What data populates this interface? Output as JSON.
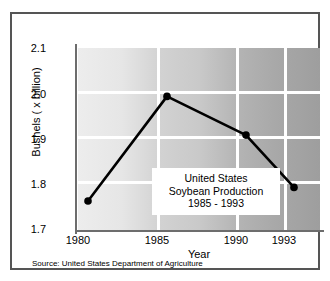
{
  "chart_data": {
    "type": "line",
    "title": "United States Soybean Production 1985 - 1993",
    "title_lines": [
      "United States",
      "Soybean Production",
      "1985 - 1993"
    ],
    "xlabel": "Year",
    "ylabel": "Bushels ( x billion)",
    "categories": [
      "1980",
      "1985",
      "1990",
      "1993"
    ],
    "x": [
      1980,
      1985,
      1990,
      1993
    ],
    "values": [
      1.79,
      2.02,
      1.935,
      1.82
    ],
    "series": [
      {
        "name": "Soybean Production",
        "values": [
          1.79,
          2.02,
          1.935,
          1.82
        ]
      }
    ],
    "ylim": [
      1.7,
      2.1
    ],
    "xlim": [
      1980,
      1993
    ],
    "yticks": [
      "2.1",
      "2.0",
      "1.9",
      "1.8",
      "1.7"
    ],
    "ytick_values": [
      2.1,
      2.0,
      1.9,
      1.8,
      1.7
    ],
    "xticks": [
      "1980",
      "1985",
      "1990",
      "1993"
    ],
    "grid": true,
    "grid_color": "#ffffff",
    "legend": "none",
    "line_color": "#000000",
    "marker": "circle",
    "marker_color": "#000000",
    "source": "Source: United States Department of Agriculture",
    "plot_background": "horizontal gradient light grey to dark grey",
    "frame_color": "#555555"
  },
  "axes": {
    "y_label": "Bushels ( x billion)",
    "x_label": "Year",
    "y_ticks": [
      "2.1",
      "2.0",
      "1.9",
      "1.8",
      "1.7"
    ],
    "x_ticks": [
      "1980",
      "1985",
      "1990",
      "1993"
    ]
  },
  "title_box": {
    "line1": "United States",
    "line2": "Soybean Production",
    "line3": "1985 - 1993"
  },
  "footer": {
    "source": "Source: United States Department of Agriculture"
  }
}
